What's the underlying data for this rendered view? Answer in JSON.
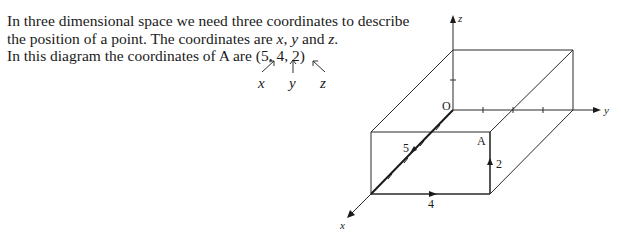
{
  "text": {
    "line1": "In three dimensional space we need three coordinates to describe",
    "line2_pre": "the position of a point. The coordinates are ",
    "var_x": "x",
    "sep1": ", ",
    "var_y": "y",
    "sep2": " and ",
    "var_z": "z",
    "line2_post": ".",
    "line3": "In this diagram the coordinates of A are (5, 4, 2)",
    "annotations": {
      "x": "x",
      "y": "y",
      "z": "z"
    }
  },
  "diagram": {
    "axes": {
      "x": "x",
      "y": "y",
      "z": "z"
    },
    "origin_label": "O",
    "point_label": "A",
    "point_coordinates": [
      5,
      4,
      2
    ],
    "path_labels": {
      "x_step": "5",
      "y_step": "4",
      "z_step": "2"
    },
    "line_color": "#2a2a2a"
  }
}
